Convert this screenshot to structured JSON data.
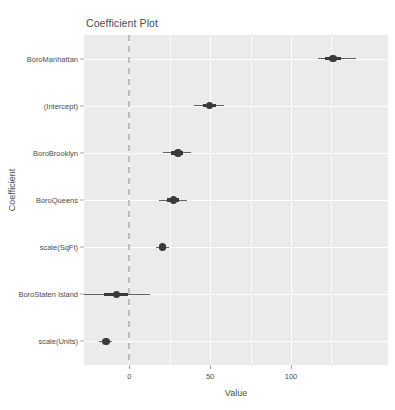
{
  "chart_data": {
    "type": "scatter",
    "title": "Coefficient Plot",
    "xlabel": "Value",
    "ylabel": "Coefficient",
    "xlim": [
      -28,
      160
    ],
    "xticks": [
      0,
      50,
      100
    ],
    "xticklabels": [
      "0",
      "50",
      "100"
    ],
    "xminor": [
      25,
      75,
      125
    ],
    "grid": true,
    "legend": "none",
    "zero_reference_line": 0,
    "categories": [
      "BoroManhattan",
      "(Intercept)",
      "BoroBrooklyn",
      "BoroQueens",
      "scale(SqFt)",
      "BoroStaten Island",
      "scale(Units)"
    ],
    "values": [
      126.0,
      49.5,
      30.0,
      27.5,
      20.5,
      -8.0,
      -14.5
    ],
    "points": [
      {
        "label": "BoroManhattan",
        "estimate": 126.0,
        "inner_low": 121.0,
        "inner_high": 131.0,
        "outer_low": 117.0,
        "outer_high": 140.0
      },
      {
        "label": "(Intercept)",
        "estimate": 49.5,
        "inner_low": 45.5,
        "inner_high": 53.5,
        "outer_low": 40.0,
        "outer_high": 58.5
      },
      {
        "label": "BoroBrooklyn",
        "estimate": 30.0,
        "inner_low": 26.0,
        "inner_high": 33.5,
        "outer_low": 21.0,
        "outer_high": 38.0
      },
      {
        "label": "BoroQueens",
        "estimate": 27.5,
        "inner_low": 23.5,
        "inner_high": 31.0,
        "outer_low": 18.5,
        "outer_high": 35.5
      },
      {
        "label": "scale(SqFt)",
        "estimate": 20.5,
        "inner_low": 18.5,
        "inner_high": 22.5,
        "outer_low": 16.5,
        "outer_high": 24.5
      },
      {
        "label": "BoroStaten Island",
        "estimate": -8.0,
        "inner_low": -15.5,
        "inner_high": -0.5,
        "outer_low": -29.0,
        "outer_high": 13.0
      },
      {
        "label": "scale(Units)",
        "estimate": -14.5,
        "inner_low": -16.5,
        "inner_high": -12.5,
        "outer_low": -18.5,
        "outer_high": -10.5
      }
    ],
    "colors": {
      "panel_background": "#ebebeb",
      "gridline": "#ffffff",
      "point": "#3a3a3a",
      "interval": "#4a4a4a",
      "zero_line": "#bdbdbd",
      "text": "#4d4d4d"
    }
  }
}
